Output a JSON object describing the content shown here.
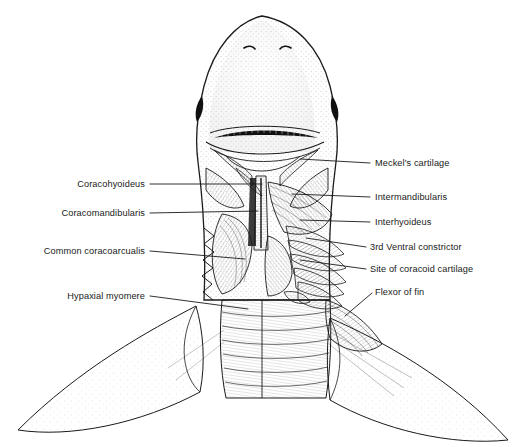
{
  "figure": {
    "view": "ventral view of shark head and branchial region with superficial musculature dissected",
    "background_color": "#ffffff",
    "ink_color": "#1a1a1a",
    "label_font_size_px": 9.2
  },
  "labels_left": [
    {
      "id": "coracohyoideus",
      "text": "Coracohyoideus",
      "text_right_x": 145,
      "baseline_y": 187,
      "leader_to_x": 262,
      "leader_to_y": 187
    },
    {
      "id": "coracomandibularis",
      "text": "Coracomandibularis",
      "text_right_x": 145,
      "baseline_y": 216,
      "leader_to_x": 258,
      "leader_to_y": 214
    },
    {
      "id": "common-coracoarcualis",
      "text": "Common coracoarcualis",
      "text_right_x": 145,
      "baseline_y": 254,
      "leader_to_x": 245,
      "leader_to_y": 262
    },
    {
      "id": "hypaxial-myomere",
      "text": "Hypaxial myomere",
      "text_right_x": 145,
      "baseline_y": 299,
      "leader_to_x": 248,
      "leader_to_y": 312
    }
  ],
  "labels_right": [
    {
      "id": "meckels-cartilage",
      "text": "Meckel's cartilage",
      "text_left_x": 375,
      "baseline_y": 166,
      "leader_to_x": 300,
      "leader_to_y": 161
    },
    {
      "id": "intermandibularis",
      "text": "Intermandibularis",
      "text_left_x": 375,
      "baseline_y": 200,
      "leader_to_x": 292,
      "leader_to_y": 196
    },
    {
      "id": "interhyoideus",
      "text": "Interhyoideus",
      "text_left_x": 375,
      "baseline_y": 225,
      "leader_to_x": 300,
      "leader_to_y": 222
    },
    {
      "id": "third-ventral-constrictor",
      "text": "3rd Ventral constrictor",
      "text_left_x": 370,
      "baseline_y": 250,
      "leader_to_x": 306,
      "leader_to_y": 240
    },
    {
      "id": "site-of-coracoid-cartilage",
      "text": "Site of coracoid cartilage",
      "text_left_x": 370,
      "baseline_y": 272,
      "leader_to_x": 300,
      "leader_to_y": 262
    },
    {
      "id": "flexor-of-fin",
      "text": "Flexor of fin",
      "text_left_x": 375,
      "baseline_y": 295,
      "leader_to_x": 345,
      "leader_to_y": 318
    }
  ]
}
